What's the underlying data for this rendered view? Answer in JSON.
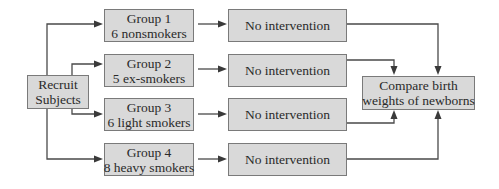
{
  "diagram": {
    "start": {
      "lines": [
        "Recruit",
        "Subjects"
      ]
    },
    "groups": [
      {
        "title": "Group 1",
        "subtitle": "6 nonsmokers"
      },
      {
        "title": "Group 2",
        "subtitle": "5 ex-smokers"
      },
      {
        "title": "Group 3",
        "subtitle": "6 light smokers"
      },
      {
        "title": "Group 4",
        "subtitle": "8 heavy smokers"
      }
    ],
    "treatments": [
      {
        "label": "No intervention"
      },
      {
        "label": "No intervention"
      },
      {
        "label": "No intervention"
      },
      {
        "label": "No intervention"
      }
    ],
    "outcome": {
      "lines": [
        "Compare birth",
        "weights of newborns"
      ]
    }
  }
}
